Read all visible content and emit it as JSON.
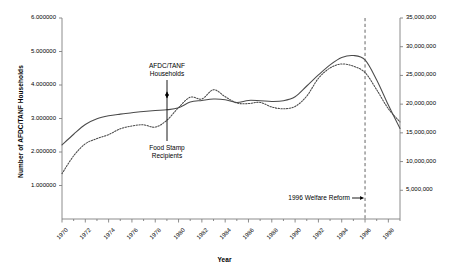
{
  "chart_data": {
    "type": "line",
    "title": "",
    "xlabel": "Year",
    "ylabel": "Number of AFDC/TANF Households",
    "ylabel_right": "",
    "xlim": [
      1970,
      1999
    ],
    "ylim": [
      0,
      6.0
    ],
    "ylim_right": [
      0,
      35000000
    ],
    "grid": false,
    "legend": "none",
    "y_ticks_left": [
      "1.000000",
      "2.000000",
      "3.000000",
      "4.000000",
      "5.000000",
      "6.000000"
    ],
    "y_tick_values_left": [
      1.0,
      2.0,
      3.0,
      4.0,
      5.0,
      6.0
    ],
    "y_ticks_right": [
      "5,000,000",
      "10,000,000",
      "15,000,000",
      "20,000,000",
      "25,000,000",
      "30,000,000",
      "35,000,000"
    ],
    "y_tick_values_right": [
      5000000,
      10000000,
      15000000,
      20000000,
      25000000,
      30000000,
      35000000
    ],
    "x_ticks": [
      "1970",
      "1972",
      "1974",
      "1976",
      "1978",
      "1980",
      "1982",
      "1984",
      "1986",
      "1988",
      "1990",
      "1992",
      "1994",
      "1996",
      "1998"
    ],
    "x_tick_values": [
      1970,
      1972,
      1974,
      1976,
      1978,
      1980,
      1982,
      1984,
      1986,
      1988,
      1990,
      1992,
      1994,
      1996,
      1998
    ],
    "x": [
      1970,
      1971,
      1972,
      1973,
      1974,
      1975,
      1976,
      1977,
      1978,
      1979,
      1980,
      1981,
      1982,
      1983,
      1984,
      1985,
      1986,
      1987,
      1988,
      1989,
      1990,
      1991,
      1992,
      1993,
      1994,
      1995,
      1996,
      1997,
      1998,
      1999
    ],
    "series": [
      {
        "name": "AFDC/TANF Households",
        "axis": "left",
        "style": "solid",
        "values": [
          2.21,
          2.53,
          2.82,
          2.99,
          3.08,
          3.13,
          3.17,
          3.21,
          3.24,
          3.26,
          3.32,
          3.49,
          3.54,
          3.58,
          3.56,
          3.48,
          3.54,
          3.53,
          3.51,
          3.53,
          3.65,
          3.97,
          4.3,
          4.6,
          4.82,
          4.88,
          4.75,
          4.15,
          3.4,
          2.7
        ]
      },
      {
        "name": "Food Stamp Recipients",
        "axis": "right",
        "style": "dotted",
        "values": [
          7900000,
          11000000,
          13100000,
          14000000,
          14700000,
          15700000,
          16200000,
          16400000,
          16000000,
          17200000,
          19400000,
          21200000,
          20900000,
          22500000,
          21300000,
          20200000,
          20100000,
          20300000,
          19500000,
          19200000,
          19600000,
          21400000,
          24500000,
          26300000,
          27000000,
          26600000,
          25500000,
          22500000,
          19200000,
          16900000
        ]
      }
    ],
    "annotations": [
      {
        "name": "afdc-tanf-households",
        "text_lines": [
          "AFDC/TANF",
          "Households"
        ],
        "arrow": "down"
      },
      {
        "name": "food-stamp-recipients",
        "text_lines": [
          "Food Stamp",
          "Recipients"
        ],
        "arrow": "up"
      },
      {
        "name": "welfare-reform-marker",
        "text": "1996 Welfare Reform",
        "arrow": "right",
        "x_value": 1996
      }
    ]
  },
  "colors": {
    "axis": "#808080",
    "line": "#4a4a4a",
    "text": "#000000",
    "background": "#ffffff",
    "marker": "#808080"
  }
}
